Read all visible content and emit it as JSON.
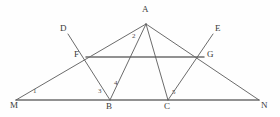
{
  "figure": {
    "type": "geometry-diagram",
    "stroke_color": "#5a5a5a",
    "baseline_color": "#6e6e6e",
    "background": "#fefefe"
  },
  "points": [
    {
      "id": "A",
      "label": "A",
      "x": 146,
      "y": 24,
      "label_x": 142,
      "label_y": 5
    },
    {
      "id": "D",
      "label": "D",
      "x": 68,
      "y": 34,
      "label_x": 60,
      "label_y": 24
    },
    {
      "id": "E",
      "label": "E",
      "x": 213,
      "y": 34,
      "label_x": 215,
      "label_y": 24
    },
    {
      "id": "F",
      "label": "F",
      "x": 86,
      "y": 57,
      "label_x": 74,
      "label_y": 50
    },
    {
      "id": "G",
      "label": "G",
      "x": 204,
      "y": 57,
      "label_x": 207,
      "label_y": 50
    },
    {
      "id": "M",
      "label": "M",
      "x": 16,
      "y": 100,
      "label_x": 10,
      "label_y": 101
    },
    {
      "id": "B",
      "label": "B",
      "x": 110,
      "y": 100,
      "label_x": 106,
      "label_y": 102
    },
    {
      "id": "C",
      "label": "C",
      "x": 168,
      "y": 100,
      "label_x": 164,
      "label_y": 102
    },
    {
      "id": "N",
      "label": "N",
      "x": 259,
      "y": 100,
      "label_x": 261,
      "label_y": 101
    }
  ],
  "segments": [
    {
      "name": "baseline-MN",
      "from": "M",
      "to": "N",
      "style": "base"
    },
    {
      "name": "line-M-F-A",
      "from": "M",
      "to": "A",
      "style": "normal"
    },
    {
      "name": "line-A-G-N",
      "from": "A",
      "to": "N",
      "style": "normal"
    },
    {
      "name": "midsegment-FG",
      "from": "F",
      "to": "G",
      "style": "base"
    },
    {
      "name": "cevian-A-B",
      "from": "A",
      "to": "B",
      "style": "normal"
    },
    {
      "name": "cevian-A-C",
      "from": "A",
      "to": "C",
      "style": "normal"
    },
    {
      "name": "line-D-F-B",
      "from": "D",
      "to": "B",
      "style": "normal"
    },
    {
      "name": "line-E-G-C",
      "from": "E",
      "to": "C",
      "style": "normal"
    }
  ],
  "angle_labels": [
    {
      "id": "1",
      "label": "1",
      "x": 33,
      "y": 88
    },
    {
      "id": "2",
      "label": "2",
      "x": 132,
      "y": 33
    },
    {
      "id": "3",
      "label": "3",
      "x": 98,
      "y": 88
    },
    {
      "id": "4",
      "label": "4",
      "x": 114,
      "y": 80
    },
    {
      "id": "5",
      "label": "5",
      "x": 172,
      "y": 89
    }
  ]
}
